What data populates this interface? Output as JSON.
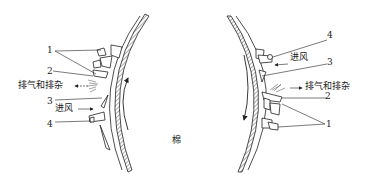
{
  "diagram": {
    "center_label": "棉",
    "left": {
      "labels": {
        "n1": "1",
        "n2": "2",
        "n3": "3",
        "n4": "4",
        "exhaust": "排气和排杂",
        "intake": "进风"
      },
      "rotation": "counterclockwise-up"
    },
    "right": {
      "labels": {
        "n1": "1",
        "n2": "2",
        "n3": "3",
        "n4": "4",
        "exhaust": "排气和排杂",
        "intake": "进风"
      },
      "rotation": "clockwise-down"
    },
    "colors": {
      "line": "#222222",
      "background": "#ffffff"
    }
  }
}
